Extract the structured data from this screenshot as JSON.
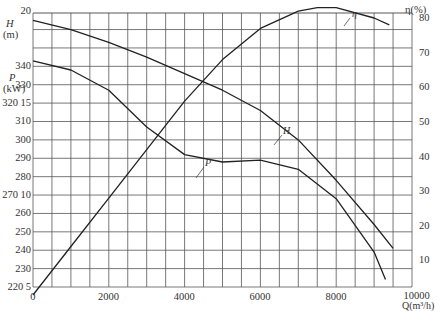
{
  "chart_data": {
    "type": "line",
    "title": "",
    "xlabel": "Q(m³/h)",
    "xlim": [
      0,
      10000
    ],
    "x_ticks": [
      0,
      2000,
      4000,
      6000,
      8000,
      10000
    ],
    "grid": true,
    "axes": {
      "left_H": {
        "label": "H",
        "unit": "(m)",
        "ticks": [
          5,
          10,
          15,
          20
        ],
        "range": [
          5,
          22
        ]
      },
      "left_P": {
        "label": "P",
        "unit": "(kW)",
        "ticks": [
          220,
          230,
          240,
          250,
          260,
          270,
          280,
          290,
          300,
          310,
          320,
          330,
          340
        ],
        "range": [
          220,
          350
        ]
      },
      "right_eta": {
        "label": "η(%)",
        "ticks": [
          10,
          20,
          30,
          40,
          50,
          60,
          70,
          80
        ],
        "range": [
          0,
          85
        ]
      }
    },
    "series": [
      {
        "name": "H",
        "axis": "left_H",
        "x": [
          0,
          1000,
          2000,
          3000,
          4000,
          5000,
          6000,
          7000,
          8000,
          9000,
          9500
        ],
        "values": [
          19.5,
          19.0,
          18.3,
          17.5,
          16.6,
          15.7,
          14.6,
          13.0,
          10.8,
          8.4,
          7.1
        ]
      },
      {
        "name": "P",
        "axis": "left_P",
        "x": [
          0,
          1000,
          2000,
          3000,
          4000,
          5000,
          6000,
          7000,
          8000,
          9000,
          9300
        ],
        "values": [
          343,
          338,
          327,
          307,
          292,
          288,
          289,
          284,
          268,
          239,
          224
        ]
      },
      {
        "name": "η",
        "axis": "right_eta",
        "x": [
          0,
          1000,
          2000,
          3000,
          4000,
          5000,
          6000,
          7000,
          7500,
          8000,
          9000,
          9400
        ],
        "values": [
          0,
          14,
          28,
          42,
          56,
          68,
          77,
          82,
          83,
          83,
          80,
          78
        ]
      }
    ],
    "curve_labels": [
      "η",
      "H",
      "P"
    ]
  },
  "labels": {
    "H": "H",
    "H_unit": "(m)",
    "P": "P",
    "P_unit": "(kW)",
    "eta": "η(%)",
    "Q": "Q(m³/h)",
    "left_rows": [
      "20",
      "340",
      "330",
      "320 15",
      "310",
      "300",
      "290",
      "280",
      "270 10",
      "260",
      "250",
      "240",
      "230",
      "220  5"
    ],
    "right_ticks": [
      "80",
      "70",
      "60",
      "50",
      "40",
      "30",
      "20",
      "10"
    ],
    "x_ticks": [
      "0",
      "2000",
      "4000",
      "6000",
      "8000",
      "10000"
    ],
    "curve_eta": "η",
    "curve_H": "H",
    "curve_P": "P"
  }
}
